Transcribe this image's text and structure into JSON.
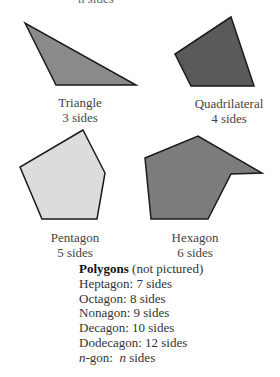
{
  "top_fragment": "n sides",
  "shapes": [
    {
      "name": "Triangle",
      "sides_label": "3 sides",
      "fill": "#8a8a8a",
      "points": "25,23 56,85 136,85"
    },
    {
      "name": "Quadrilateral",
      "sides_label": "4 sides",
      "fill": "#5a5a5a",
      "points": "231,17 175,54 191,86 254,86"
    },
    {
      "name": "Pentagon",
      "sides_label": "5 sides",
      "fill": "#dcdcdc",
      "points": "83,130 20,167 42,219 97,219 105,173"
    },
    {
      "name": "Hexagon",
      "sides_label": "6 sides",
      "fill": "#7c7c7c",
      "points": "145,158 198,136 262,173 231,174 208,219 151,219"
    }
  ],
  "polygons_list": {
    "heading_bold": "Polygons",
    "heading_rest": " (not pictured)",
    "items": [
      "Heptagon: 7 sides",
      "Octagon: 8 sides",
      "Nonagon: 9 sides",
      "Decagon: 10 sides",
      "Dodecagon: 12 sides"
    ],
    "ngon_var": "n",
    "ngon_mid": "-gon:  ",
    "ngon_var2": "n",
    "ngon_end": " sides"
  }
}
